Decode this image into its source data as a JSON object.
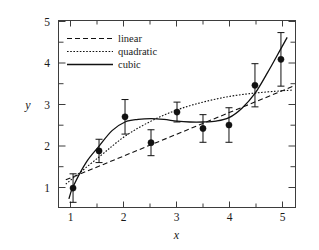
{
  "chart_data": {
    "type": "scatter",
    "title": "",
    "xlabel": "x",
    "ylabel": "y",
    "xlim": [
      0.72,
      5.28
    ],
    "ylim": [
      0.72,
      5.05
    ],
    "xticks": [
      1,
      2,
      3,
      4,
      5
    ],
    "yticks": [
      1,
      2,
      3,
      4,
      5
    ],
    "xminor_step": 0.5,
    "yminor_step": 0.5,
    "grid": false,
    "legend_position": "upper-left-inside",
    "points": {
      "x": [
        1.0,
        1.5,
        2.0,
        2.5,
        3.0,
        3.5,
        4.0,
        4.5,
        5.0
      ],
      "y": [
        1.17,
        2.03,
        2.82,
        2.22,
        2.93,
        2.55,
        2.63,
        3.55,
        4.15
      ],
      "yerr": [
        0.33,
        0.27,
        0.4,
        0.3,
        0.23,
        0.32,
        0.4,
        0.5,
        0.62
      ]
    },
    "series": [
      {
        "name": "linear",
        "style": "dashed",
        "type": "line",
        "fit": "y = 0.92 + 0.50x",
        "x": [
          0.86,
          5.22
        ],
        "y": [
          1.36,
          3.52
        ]
      },
      {
        "name": "quadratic",
        "style": "dotted",
        "type": "line",
        "fit": "y = 0.05 + 1.45x - 0.145x^2",
        "x": [
          0.86,
          1.5,
          2.0,
          2.5,
          3.0,
          3.5,
          4.0,
          4.5,
          5.0,
          5.22
        ],
        "y": [
          1.26,
          1.89,
          2.37,
          2.72,
          2.98,
          3.16,
          3.29,
          3.37,
          3.42,
          3.44
        ]
      },
      {
        "name": "cubic",
        "style": "solid",
        "type": "line",
        "fit": "cubic spline fit",
        "x": [
          0.92,
          1.0,
          1.25,
          1.5,
          1.75,
          2.0,
          2.25,
          2.5,
          2.75,
          3.0,
          3.25,
          3.5,
          3.75,
          4.0,
          4.25,
          4.5,
          4.75,
          5.0,
          5.12
        ],
        "y": [
          0.92,
          1.2,
          1.76,
          2.14,
          2.5,
          2.7,
          2.76,
          2.78,
          2.76,
          2.72,
          2.7,
          2.7,
          2.72,
          2.8,
          3.02,
          3.36,
          3.86,
          4.4,
          4.66
        ]
      }
    ],
    "legend_entries": [
      {
        "label": "linear",
        "style": "dashed"
      },
      {
        "label": "quadratic",
        "style": "dotted"
      },
      {
        "label": "cubic",
        "style": "solid"
      }
    ]
  }
}
